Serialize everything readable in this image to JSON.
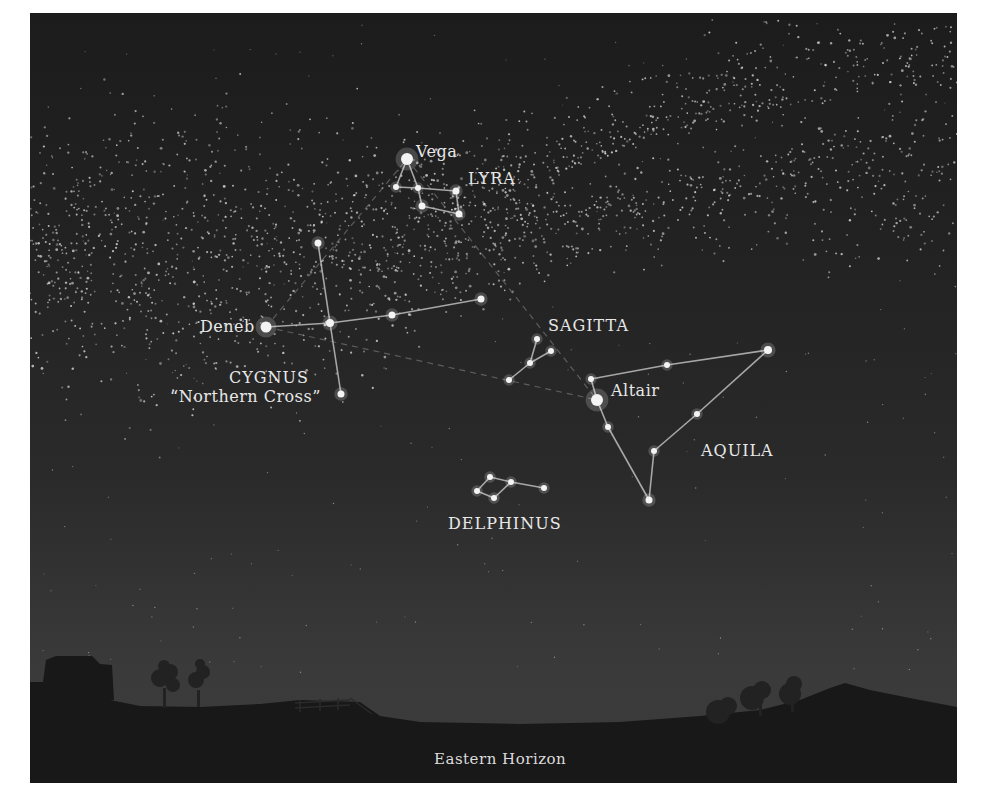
{
  "caption": "Eastern Horizon",
  "scene": {
    "description": "Summer night sky over the eastern horizon showing the Milky Way and constellations Lyra, Cygnus, Sagitta, Aquila and Delphinus",
    "colors": {
      "sky_top": "#1c1c1c",
      "sky_bottom": "#3c3c3c",
      "ground": "#181818",
      "label": "#e8e8e8",
      "line": "#bdbdbd"
    }
  },
  "labels": {
    "vega": "Vega",
    "lyra": "LYRA",
    "deneb": "Deneb",
    "cygnus": "CYGNUS",
    "northern_cross": "“Northern Cross”",
    "sagitta": "SAGITTA",
    "altair": "Altair",
    "aquila": "AQUILA",
    "delphinus": "DELPHINUS"
  },
  "constellations": [
    {
      "name": "LYRA",
      "stars": [
        [
          407,
          159,
          6
        ],
        [
          396,
          187,
          3
        ],
        [
          418,
          188,
          3
        ],
        [
          456,
          191,
          3.5
        ],
        [
          422,
          206,
          3.5
        ],
        [
          459,
          214,
          3.5
        ]
      ],
      "lines": [
        [
          0,
          1
        ],
        [
          0,
          2
        ],
        [
          1,
          2
        ],
        [
          2,
          3
        ],
        [
          2,
          4
        ],
        [
          3,
          5
        ],
        [
          4,
          5
        ]
      ]
    },
    {
      "name": "CYGNUS",
      "stars": [
        [
          266,
          327,
          5.5
        ],
        [
          330,
          323,
          4
        ],
        [
          392,
          315,
          3.5
        ],
        [
          481,
          299,
          3.5
        ],
        [
          318,
          243,
          3.5
        ],
        [
          341,
          394,
          3.5
        ]
      ],
      "lines": [
        [
          0,
          1
        ],
        [
          1,
          2
        ],
        [
          2,
          3
        ],
        [
          4,
          1
        ],
        [
          1,
          5
        ]
      ]
    },
    {
      "name": "SAGITTA",
      "stars": [
        [
          537,
          339,
          3
        ],
        [
          551,
          351,
          3
        ],
        [
          530,
          363,
          3
        ],
        [
          509,
          380,
          3
        ]
      ],
      "lines": [
        [
          0,
          2
        ],
        [
          1,
          2
        ],
        [
          2,
          3
        ]
      ]
    },
    {
      "name": "AQUILA",
      "stars": [
        [
          597,
          400,
          6
        ],
        [
          591,
          379,
          3
        ],
        [
          667,
          365,
          3
        ],
        [
          768,
          350,
          4
        ],
        [
          697,
          414,
          3
        ],
        [
          608,
          427,
          3
        ],
        [
          654,
          451,
          3
        ],
        [
          649,
          500,
          3.5
        ]
      ],
      "lines": [
        [
          1,
          0
        ],
        [
          1,
          2
        ],
        [
          2,
          3
        ],
        [
          3,
          4
        ],
        [
          4,
          6
        ],
        [
          6,
          7
        ],
        [
          7,
          5
        ],
        [
          5,
          0
        ]
      ]
    },
    {
      "name": "DELPHINUS",
      "stars": [
        [
          490,
          477,
          3
        ],
        [
          511,
          482,
          3
        ],
        [
          544,
          488,
          3
        ],
        [
          477,
          491,
          3
        ],
        [
          494,
          498,
          3
        ]
      ],
      "lines": [
        [
          0,
          1
        ],
        [
          1,
          2
        ],
        [
          0,
          3
        ],
        [
          3,
          4
        ],
        [
          4,
          1
        ]
      ]
    }
  ],
  "asterism_lines": [
    [
      [
        266,
        327
      ],
      [
        407,
        159
      ]
    ],
    [
      [
        407,
        159
      ],
      [
        597,
        400
      ]
    ],
    [
      [
        266,
        327
      ],
      [
        597,
        400
      ]
    ]
  ]
}
